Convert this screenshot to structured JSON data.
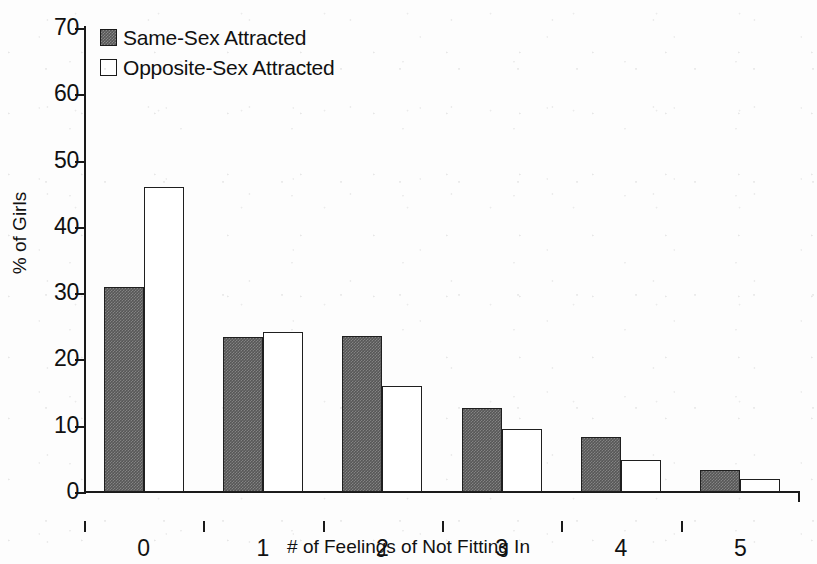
{
  "chart_data": {
    "type": "bar",
    "title": "",
    "subtitle": "",
    "xlabel": "# of Feelings of Not Fitting In",
    "ylabel": "% of Girls",
    "categories": [
      "0",
      "1",
      "2",
      "3",
      "4",
      "5"
    ],
    "series": [
      {
        "name": "Same-Sex Attracted",
        "values": [
          31.0,
          23.4,
          23.5,
          12.7,
          8.3,
          3.3
        ],
        "swatch": "same-sex",
        "color": "#575757"
      },
      {
        "name": "Opposite-Sex Attracted",
        "values": [
          46.0,
          24.1,
          16.0,
          9.5,
          4.8,
          2.0
        ],
        "swatch": "opposite-sex",
        "color": "#ffffff"
      }
    ],
    "ylim": [
      0,
      70
    ],
    "yticks": [
      0,
      10,
      20,
      30,
      40,
      50,
      60,
      70
    ],
    "ytick_labels": [
      "0",
      "10",
      "20",
      "30",
      "40",
      "50",
      "60",
      "70"
    ],
    "grid": false,
    "legend_position": "top-left",
    "axis_color": "#1a1a1a",
    "bar_border_color": "#1f1f1f",
    "background": "#fdfdfd"
  },
  "legend": {
    "items": [
      {
        "label": "Same-Sex Attracted",
        "swatch": "same-sex"
      },
      {
        "label": "Opposite-Sex Attracted",
        "swatch": "opposite-sex"
      }
    ]
  }
}
